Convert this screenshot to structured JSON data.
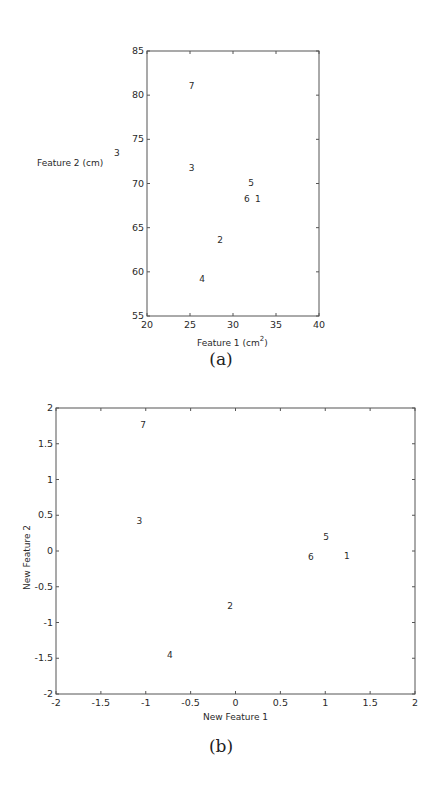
{
  "figures": [
    {
      "caption": "(a)",
      "xlabel": "Feature 1 (cm",
      "xlabel_sup": "2",
      "xlabel_close": ")",
      "ylabel": "Feature 2 (cm)",
      "ylabel_sup": "3",
      "xticks": [
        "20",
        "25",
        "30",
        "35",
        "40"
      ],
      "yticks": [
        "55",
        "60",
        "65",
        "70",
        "75",
        "80",
        "85"
      ]
    },
    {
      "caption": "(b)",
      "xlabel": "New Feature 1",
      "ylabel": "New Feature 2",
      "xticks": [
        "-2",
        "-1.5",
        "-1",
        "-0.5",
        "0",
        "0.5",
        "1",
        "1.5",
        "2"
      ],
      "yticks": [
        "-2",
        "-1.5",
        "-1",
        "-0.5",
        "0",
        "0.5",
        "1",
        "1.5",
        "2"
      ]
    }
  ],
  "chart_data": [
    {
      "type": "scatter",
      "title": "(a)",
      "xlabel": "Feature 1 (cm^2)",
      "ylabel": "Feature 2 (cm^3)",
      "xlim": [
        20,
        40
      ],
      "ylim": [
        55,
        85
      ],
      "grid": false,
      "marker": "text-label",
      "points": [
        {
          "label": "1",
          "x": 32.9,
          "y": 68.2
        },
        {
          "label": "2",
          "x": 28.5,
          "y": 63.6
        },
        {
          "label": "3",
          "x": 25.2,
          "y": 71.8
        },
        {
          "label": "4",
          "x": 26.4,
          "y": 59.2
        },
        {
          "label": "5",
          "x": 32.1,
          "y": 70.1
        },
        {
          "label": "6",
          "x": 31.6,
          "y": 68.2
        },
        {
          "label": "7",
          "x": 25.2,
          "y": 81.0
        }
      ]
    },
    {
      "type": "scatter",
      "title": "(b)",
      "xlabel": "New Feature 1",
      "ylabel": "New Feature 2",
      "xlim": [
        -2,
        2
      ],
      "ylim": [
        -2,
        2
      ],
      "grid": false,
      "marker": "text-label",
      "points": [
        {
          "label": "1",
          "x": 1.24,
          "y": -0.07
        },
        {
          "label": "2",
          "x": -0.06,
          "y": -0.77
        },
        {
          "label": "3",
          "x": -1.07,
          "y": 0.42
        },
        {
          "label": "4",
          "x": -0.73,
          "y": -1.45
        },
        {
          "label": "5",
          "x": 1.01,
          "y": 0.2
        },
        {
          "label": "6",
          "x": 0.84,
          "y": -0.08
        },
        {
          "label": "7",
          "x": -1.03,
          "y": 1.76
        }
      ]
    }
  ]
}
